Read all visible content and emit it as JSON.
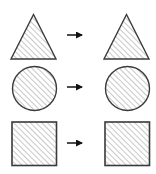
{
  "figure": {
    "background_color": "#ffffff",
    "outline_color": "#3a3a3a",
    "hatch_color": "#9a9a9a",
    "arrow_color": "#111111",
    "width": 156,
    "height": 174
  },
  "rows": [
    {
      "id": "triangle-row",
      "label": "Triangle row",
      "y": 8,
      "source": {
        "shape": "triangle",
        "label": "hatched triangle",
        "x": 10,
        "y": 5,
        "width": 46,
        "height": 46,
        "fill": "diagonal-hatch"
      },
      "arrow": {
        "label": "right-arrow",
        "x": 66,
        "y": 22,
        "length": 24,
        "direction": "right"
      },
      "target": {
        "shape": "triangle",
        "label": "hatched triangle",
        "x": 103,
        "y": 5,
        "width": 46,
        "height": 46,
        "fill": "diagonal-hatch"
      }
    },
    {
      "id": "circle-row",
      "label": "Circle row",
      "y": 61,
      "source": {
        "shape": "circle",
        "label": "hatched circle",
        "x": 11,
        "y": 4,
        "width": 45,
        "height": 45,
        "fill": "diagonal-hatch"
      },
      "arrow": {
        "label": "right-arrow",
        "x": 66,
        "y": 21,
        "length": 24,
        "direction": "right"
      },
      "target": {
        "shape": "circle",
        "label": "hatched circle",
        "x": 104,
        "y": 4,
        "width": 45,
        "height": 45,
        "fill": "diagonal-hatch"
      }
    },
    {
      "id": "square-row",
      "label": "Square row",
      "y": 117,
      "source": {
        "shape": "square",
        "label": "hatched square",
        "x": 11,
        "y": 4,
        "width": 45,
        "height": 44,
        "fill": "diagonal-hatch"
      },
      "arrow": {
        "label": "right-arrow",
        "x": 66,
        "y": 21,
        "length": 24,
        "direction": "right"
      },
      "target": {
        "shape": "square",
        "label": "hatched square",
        "x": 104,
        "y": 4,
        "width": 45,
        "height": 44,
        "fill": "diagonal-hatch"
      }
    }
  ]
}
